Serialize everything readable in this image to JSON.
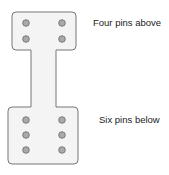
{
  "diagram": {
    "labels": {
      "top": "Four pins above",
      "bottom": "Six pins below"
    },
    "top_pad": {
      "pin_count": 4,
      "columns": 2,
      "rows": 2
    },
    "bottom_pad": {
      "pin_count": 6,
      "columns": 2,
      "rows": 3
    },
    "colors": {
      "board_fill": "#f4f4f4",
      "board_stroke": "#777777",
      "pin_fill": "#a9a9a9",
      "pin_stroke": "#6a6a6a"
    }
  }
}
